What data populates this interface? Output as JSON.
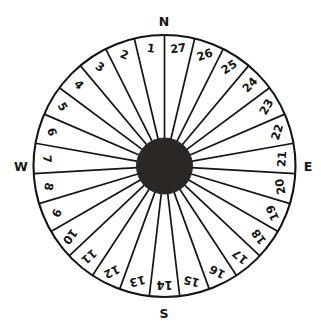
{
  "figure": {
    "colors": {
      "hub": "#2b2724",
      "stroke": "#141414",
      "background": "#ffffff"
    },
    "geometry": {
      "center_x": 164.5,
      "center_y": 166,
      "outer_radius": 131,
      "hub_radius": 28,
      "sector_count": 27,
      "sector_angle_deg": 13.333,
      "direction": "counterclockwise",
      "first_sector_offset_deg": -6.667
    }
  },
  "cardinals": [
    {
      "label": "N",
      "x": 164,
      "y": 22
    },
    {
      "label": "E",
      "x": 308,
      "y": 167
    },
    {
      "label": "S",
      "x": 164,
      "y": 314
    },
    {
      "label": "W",
      "x": 21,
      "y": 167
    }
  ],
  "sectors": [
    {
      "number": "1"
    },
    {
      "number": "2"
    },
    {
      "number": "3"
    },
    {
      "number": "4"
    },
    {
      "number": "5"
    },
    {
      "number": "6"
    },
    {
      "number": "7"
    },
    {
      "number": "8"
    },
    {
      "number": "9"
    },
    {
      "number": "10"
    },
    {
      "number": "11"
    },
    {
      "number": "12"
    },
    {
      "number": "13"
    },
    {
      "number": "14"
    },
    {
      "number": "15"
    },
    {
      "number": "16"
    },
    {
      "number": "17"
    },
    {
      "number": "18"
    },
    {
      "number": "19"
    },
    {
      "number": "20"
    },
    {
      "number": "21"
    },
    {
      "number": "22"
    },
    {
      "number": "23"
    },
    {
      "number": "24"
    },
    {
      "number": "25"
    },
    {
      "number": "26"
    },
    {
      "number": "27"
    }
  ],
  "chart_data": {
    "type": "pie",
    "categories": [
      "1",
      "2",
      "3",
      "4",
      "5",
      "6",
      "7",
      "8",
      "9",
      "10",
      "11",
      "12",
      "13",
      "14",
      "15",
      "16",
      "17",
      "18",
      "19",
      "20",
      "21",
      "22",
      "23",
      "24",
      "25",
      "26",
      "27"
    ],
    "values": [
      1,
      1,
      1,
      1,
      1,
      1,
      1,
      1,
      1,
      1,
      1,
      1,
      1,
      1,
      1,
      1,
      1,
      1,
      1,
      1,
      1,
      1,
      1,
      1,
      1,
      1,
      1
    ],
    "annotations": [
      "N",
      "E",
      "S",
      "W"
    ],
    "legend": "none",
    "grid": false,
    "xlabel": "",
    "ylabel": ""
  }
}
